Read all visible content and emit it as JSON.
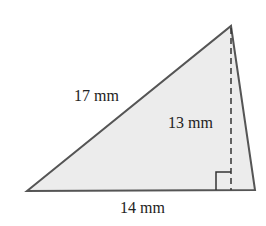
{
  "diagram": {
    "type": "triangle",
    "labels": {
      "hypotenuse_side": "17 mm",
      "height": "13 mm",
      "base": "14 mm"
    },
    "colors": {
      "fill": "#ececec",
      "stroke": "#555555"
    }
  }
}
